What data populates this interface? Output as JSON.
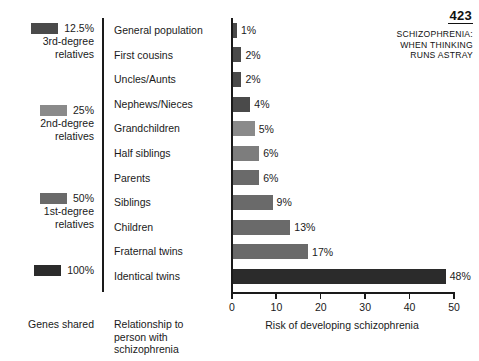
{
  "header": {
    "page_number": "423",
    "chapter_title_lines": [
      "SCHIZOPHRENIA:",
      "WHEN THINKING",
      "RUNS ASTRAY"
    ]
  },
  "legend": {
    "footer_label": "Genes shared",
    "groups": [
      {
        "percent": "12.5%",
        "sub_line1": "3rd-degree",
        "sub_line2": "relatives",
        "color": "#4a4a4a",
        "top": 4
      },
      {
        "percent": "25%",
        "sub_line1": "2nd-degree",
        "sub_line2": "relatives",
        "color": "#8a8a8a",
        "top": 86
      },
      {
        "percent": "50%",
        "sub_line1": "1st-degree",
        "sub_line2": "relatives",
        "color": "#6a6a6a",
        "top": 174
      },
      {
        "percent": "100%",
        "sub_line1": "",
        "sub_line2": "",
        "color": "#2b2b2b",
        "top": 246
      }
    ]
  },
  "relationship_column": {
    "footer_lines": [
      "Relationship to",
      "person with",
      "schizophrenia"
    ]
  },
  "chart_data": {
    "type": "bar",
    "orientation": "horizontal",
    "title": "",
    "xlabel": "Risk of developing schizophrenia",
    "ylabel": "",
    "xlim": [
      0,
      50
    ],
    "xticks": [
      0,
      10,
      20,
      30,
      40,
      50
    ],
    "xtick_labels": [
      "0",
      "10",
      "20",
      "30",
      "40",
      "50"
    ],
    "grid": false,
    "legend_position": "left",
    "categories": [
      "General population",
      "First cousins",
      "Uncles/Aunts",
      "Nephews/Nieces",
      "Grandchildren",
      "Half siblings",
      "Parents",
      "Siblings",
      "Children",
      "Fraternal twins",
      "Identical twins"
    ],
    "values": [
      1,
      2,
      2,
      4,
      5,
      6,
      6,
      9,
      13,
      17,
      48
    ],
    "value_labels": [
      "1%",
      "2%",
      "2%",
      "4%",
      "5%",
      "6%",
      "6%",
      "9%",
      "13%",
      "17%",
      "48%"
    ],
    "bar_colors": [
      "#4a4a4a",
      "#4a4a4a",
      "#4a4a4a",
      "#4a4a4a",
      "#8a8a8a",
      "#7d7d7d",
      "#6a6a6a",
      "#6a6a6a",
      "#6a6a6a",
      "#6a6a6a",
      "#2b2b2b"
    ]
  }
}
